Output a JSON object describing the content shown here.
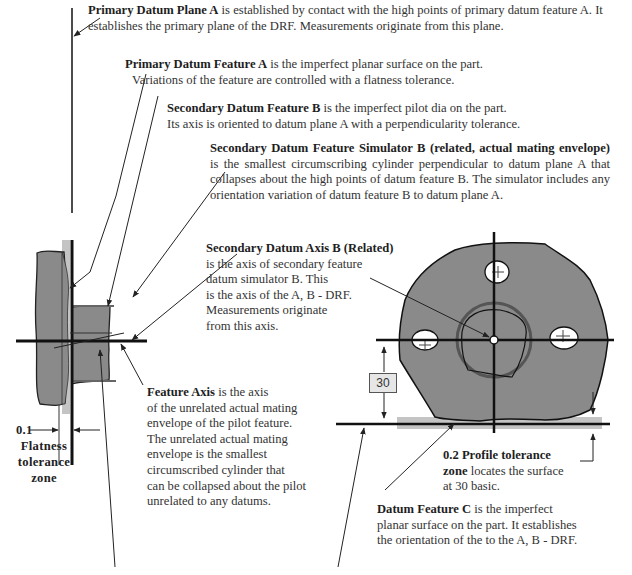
{
  "notes": {
    "primary_datum_plane": {
      "title": "Primary Datum Plane A",
      "text": " is established by contact with the high points of primary datum feature A.  It establishes the primary plane of the DRF.   Measurements originate from this plane."
    },
    "primary_datum_feature": {
      "title": "Primary Datum Feature A",
      "line1": " is the imperfect planar surface on the part.",
      "line2": "Variations of the feature are controlled with a flatness tolerance."
    },
    "secondary_datum_feature": {
      "title": "Secondary Datum Feature B",
      "line1": " is the imperfect pilot dia on the part.",
      "line2": "Its axis is oriented to datum plane A with a perpendicularity tolerance."
    },
    "secondary_simulator": {
      "title": "Secondary Datum Feature Simulator B (related, actual mating envelope)",
      "text": " is the smallest circumscribing cylinder perpendicular to datum plane A that collapses about the high points of datum feature B.  The simulator includes any orientation variation of datum feature B to datum plane A."
    },
    "secondary_axis": {
      "title": "Secondary Datum Axis B (Related)",
      "lines": [
        "is the axis of secondary feature",
        "datum simulator B.  This",
        "is the axis of the A, B - DRF.",
        "Measurements originate",
        "from this axis."
      ]
    },
    "feature_axis": {
      "title": "Feature Axis",
      "line1": " is the axis",
      "lines": [
        "of the unrelated actual mating",
        "envelope of the pilot feature.",
        "The unrelated actual mating",
        "envelope is the smallest",
        "circumscribed cylinder that",
        "can be collapsed about the pilot",
        "unrelated to any datums."
      ]
    },
    "flatness": {
      "value": "0.1",
      "lines": [
        "Flatness",
        "tolerance",
        "zone"
      ]
    },
    "profile": {
      "title": "0.2 Profile tolerance",
      "title2": "zone",
      "line1": " locates the surface",
      "line2": "at 30 basic."
    },
    "datum_feature_c": {
      "title": "Datum Feature C",
      "line1": " is the imperfect",
      "line2": "planar surface on the part. It establishes",
      "line3": "the orientation of the to the A, B - DRF."
    }
  },
  "dimension": {
    "basic_value": "30"
  },
  "colors": {
    "part_fill": "#8a8a8a",
    "zone_fill": "#c4c4c4",
    "line": "#111111",
    "text": "#333333"
  }
}
